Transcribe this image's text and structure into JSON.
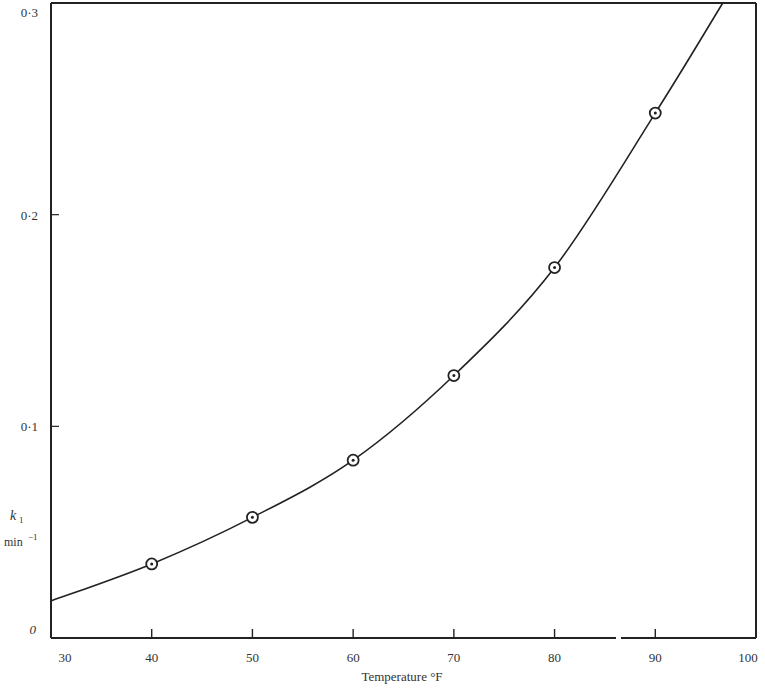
{
  "chart_data": {
    "type": "line",
    "title": "",
    "xlabel": "Temperature °F",
    "ylabel": "k1 min^-1",
    "ylabel_parts": {
      "symbol": "k",
      "subscript": "1",
      "unit": "min",
      "unit_exp": "−1"
    },
    "xlim": [
      30,
      100
    ],
    "ylim": [
      0,
      0.3
    ],
    "x_ticks": [
      30,
      40,
      50,
      60,
      70,
      80,
      90,
      100
    ],
    "x_tick_labels": [
      "30",
      "40",
      "50",
      "60",
      "70",
      "80",
      "90",
      "100"
    ],
    "y_ticks": [
      0,
      0.1,
      0.2,
      0.3
    ],
    "y_tick_labels": [
      "0",
      "0·1",
      "0·2",
      "0·3"
    ],
    "grid": false,
    "legend": null,
    "series": [
      {
        "name": "measured k1",
        "marker": "circled-dot",
        "x": [
          40,
          50,
          60,
          70,
          80,
          90
        ],
        "values": [
          0.035,
          0.057,
          0.084,
          0.124,
          0.175,
          0.248
        ]
      },
      {
        "name": "fitted curve",
        "marker": "none",
        "x": [
          30,
          40,
          50,
          60,
          70,
          80,
          90,
          96.7
        ],
        "values": [
          0.0175,
          0.035,
          0.057,
          0.084,
          0.124,
          0.175,
          0.248,
          0.3
        ]
      }
    ]
  },
  "colors": {
    "ink": "#222222",
    "background": "#ffffff"
  }
}
